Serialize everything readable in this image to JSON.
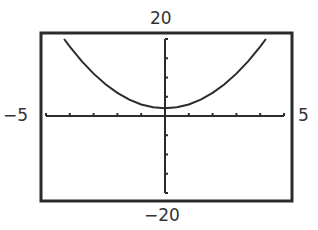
{
  "chart_data": {
    "type": "line",
    "title": "",
    "xlabel": "",
    "ylabel": "",
    "xlim": [
      -5,
      5
    ],
    "ylim": [
      -20,
      20
    ],
    "xticks_step": 1,
    "yticks_step": 5,
    "grid": false,
    "function": "y = x^2 + 2",
    "series": [
      {
        "name": "f(x)",
        "x": [
          -4.24,
          -4,
          -3.5,
          -3,
          -2.5,
          -2,
          -1.5,
          -1,
          -0.5,
          0,
          0.5,
          1,
          1.5,
          2,
          2.5,
          3,
          3.5,
          4,
          4.24
        ],
        "y": [
          20,
          18,
          14.25,
          11,
          8.25,
          6,
          4.25,
          3,
          2.25,
          2,
          2.25,
          3,
          4.25,
          6,
          8.25,
          11,
          14.25,
          18,
          20
        ]
      }
    ],
    "window_labels": {
      "ymax": "20",
      "ymin": "−20",
      "xmin": "−5",
      "xmax": "5"
    },
    "colors": {
      "frame": "#2b2b2b",
      "curve": "#2b2b2b",
      "axes": "#2b2b2b"
    }
  }
}
